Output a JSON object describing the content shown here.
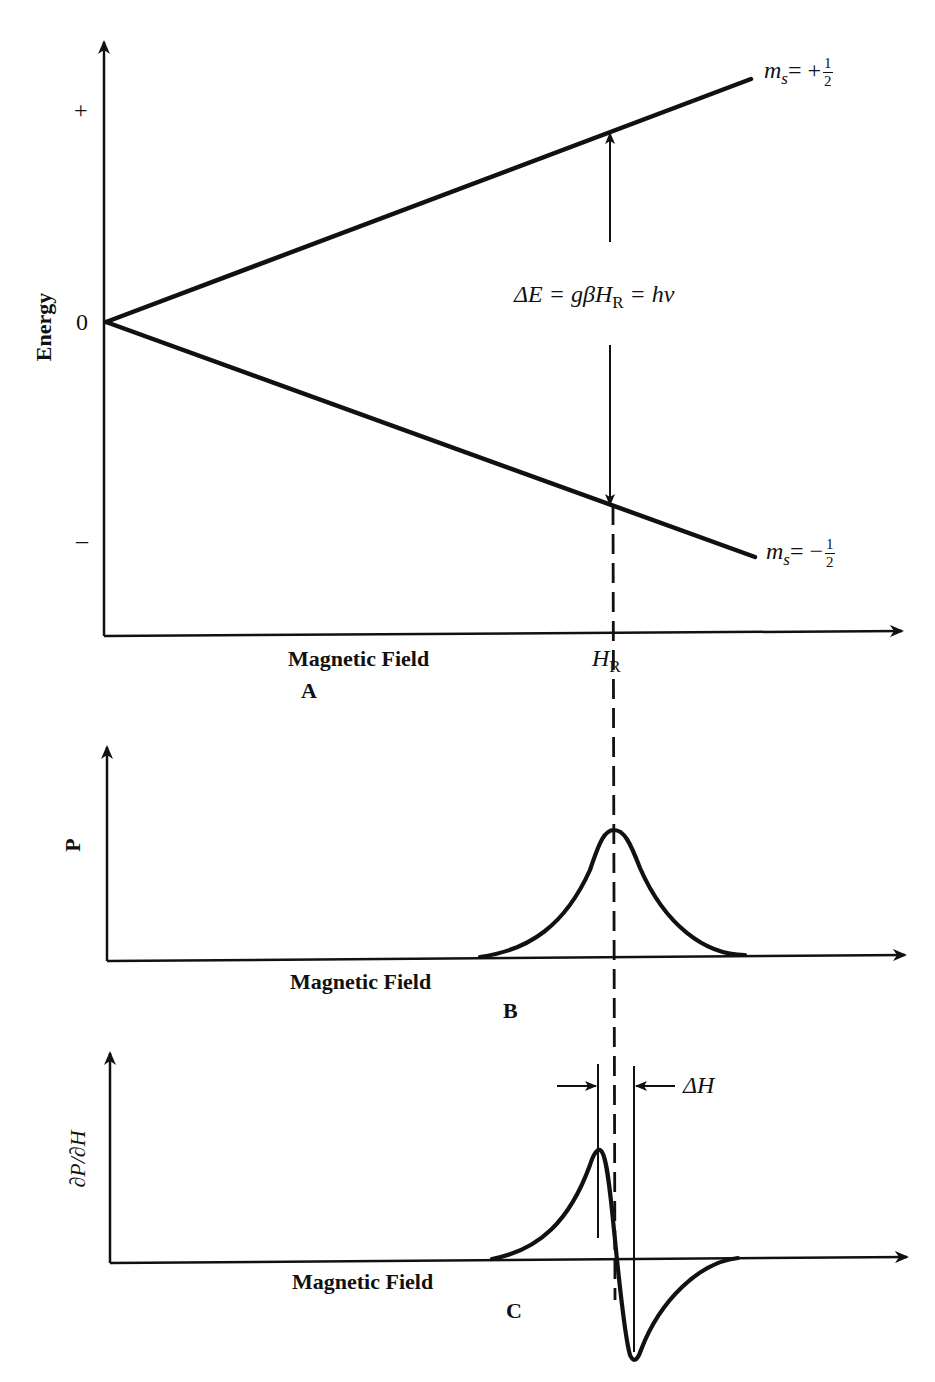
{
  "figure": {
    "line_color": "#111111",
    "background": "#ffffff"
  },
  "panel_a": {
    "letter": "A",
    "y_axis_label": "Energy",
    "y_ticks": {
      "plus": "+",
      "zero": "0",
      "minus": "–"
    },
    "x_axis_label": "Magnetic Field",
    "resonance_field_label": "H",
    "resonance_field_subscript": "R",
    "upper_level": {
      "symbol": "m",
      "subscript": "s",
      "equals_sign": "= +",
      "numerator": "1",
      "denominator": "2"
    },
    "lower_level": {
      "symbol": "m",
      "subscript": "s",
      "equals_sign": "= −",
      "numerator": "1",
      "denominator": "2"
    },
    "transition_equation": {
      "delta_e": "ΔE",
      "eq1": " = gβH",
      "sub_r": "R",
      "eq2": " = hν"
    }
  },
  "panel_b": {
    "letter": "B",
    "y_axis_label": "P",
    "x_axis_label": "Magnetic Field",
    "curve": "absorption (Lorentzian-like peak centered at H_R)"
  },
  "panel_c": {
    "letter": "C",
    "y_axis_label": "∂P/∂H",
    "x_axis_label": "Magnetic Field",
    "linewidth_label": "ΔH",
    "curve": "first-derivative of absorption, zero crossing at H_R"
  }
}
